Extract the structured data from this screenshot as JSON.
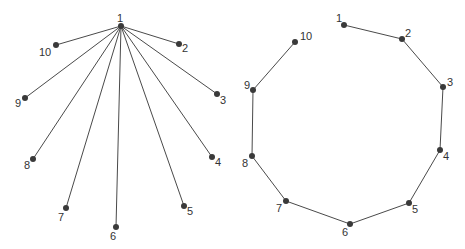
{
  "diagrams": [
    {
      "name": "star-graph",
      "nodes": [
        {
          "id": "1",
          "x": 121,
          "y": 26,
          "lx": 117,
          "ly": 22
        },
        {
          "id": "2",
          "x": 179,
          "y": 44,
          "lx": 182,
          "ly": 52
        },
        {
          "id": "3",
          "x": 217,
          "y": 94,
          "lx": 220,
          "ly": 104
        },
        {
          "id": "4",
          "x": 212,
          "y": 157,
          "lx": 215,
          "ly": 166
        },
        {
          "id": "5",
          "x": 184,
          "y": 206,
          "lx": 187,
          "ly": 215
        },
        {
          "id": "6",
          "x": 116,
          "y": 227,
          "lx": 110,
          "ly": 240
        },
        {
          "id": "7",
          "x": 66,
          "y": 208,
          "lx": 58,
          "ly": 221
        },
        {
          "id": "8",
          "x": 33,
          "y": 159,
          "lx": 24,
          "ly": 169
        },
        {
          "id": "9",
          "x": 25,
          "y": 98,
          "lx": 15,
          "ly": 107
        },
        {
          "id": "10",
          "x": 56,
          "y": 45,
          "lx": 39,
          "ly": 56
        }
      ],
      "edges": [
        [
          "1",
          "2"
        ],
        [
          "1",
          "3"
        ],
        [
          "1",
          "4"
        ],
        [
          "1",
          "5"
        ],
        [
          "1",
          "6"
        ],
        [
          "1",
          "7"
        ],
        [
          "1",
          "8"
        ],
        [
          "1",
          "9"
        ],
        [
          "1",
          "10"
        ]
      ]
    },
    {
      "name": "path-graph",
      "nodes": [
        {
          "id": "1",
          "x": 344,
          "y": 25,
          "lx": 336,
          "ly": 22
        },
        {
          "id": "2",
          "x": 402,
          "y": 39,
          "lx": 405,
          "ly": 37
        },
        {
          "id": "3",
          "x": 443,
          "y": 87,
          "lx": 447,
          "ly": 86
        },
        {
          "id": "4",
          "x": 440,
          "y": 150,
          "lx": 443,
          "ly": 160
        },
        {
          "id": "5",
          "x": 409,
          "y": 203,
          "lx": 412,
          "ly": 213
        },
        {
          "id": "6",
          "x": 350,
          "y": 224,
          "lx": 342,
          "ly": 236
        },
        {
          "id": "7",
          "x": 286,
          "y": 201,
          "lx": 276,
          "ly": 212
        },
        {
          "id": "8",
          "x": 252,
          "y": 156,
          "lx": 242,
          "ly": 167
        },
        {
          "id": "9",
          "x": 253,
          "y": 90,
          "lx": 244,
          "ly": 89
        },
        {
          "id": "10",
          "x": 295,
          "y": 42,
          "lx": 300,
          "ly": 40
        }
      ],
      "edges": [
        [
          "1",
          "2"
        ],
        [
          "2",
          "3"
        ],
        [
          "3",
          "4"
        ],
        [
          "4",
          "5"
        ],
        [
          "5",
          "6"
        ],
        [
          "6",
          "7"
        ],
        [
          "7",
          "8"
        ],
        [
          "8",
          "9"
        ],
        [
          "9",
          "10"
        ]
      ]
    }
  ],
  "colors": {
    "edge": "#4a4a4a",
    "node": "#3a3a3a",
    "label": "#333333"
  }
}
